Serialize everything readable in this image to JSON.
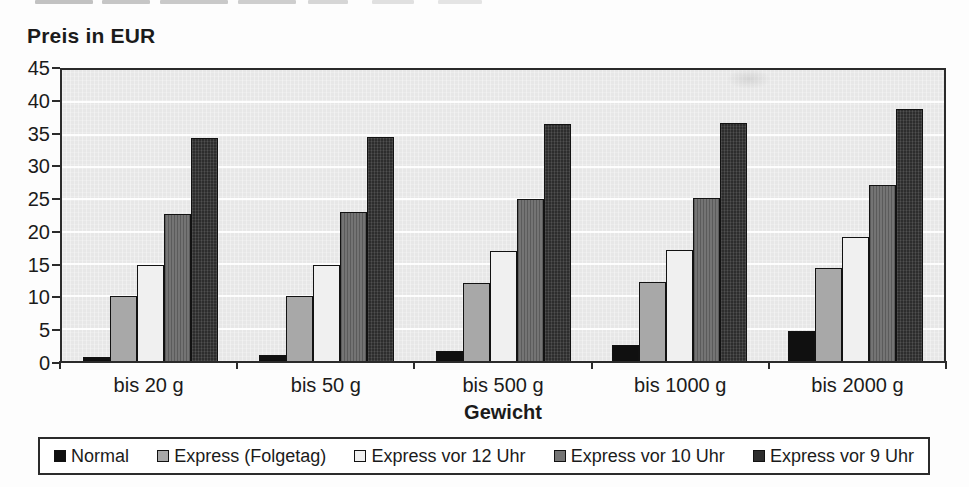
{
  "chart_data": {
    "type": "bar",
    "title": "Preis in EUR",
    "xlabel": "Gewicht",
    "ylabel": "Preis in EUR",
    "categories": [
      "bis 20 g",
      "bis 50 g",
      "bis 500 g",
      "bis 1000 g",
      "bis 2000 g"
    ],
    "series": [
      {
        "name": "Normal",
        "color": "#101010",
        "values": [
          0.6,
          1,
          1.6,
          2.5,
          4.7
        ]
      },
      {
        "name": "Express (Folgetag)",
        "color": "#a8a8a8",
        "values": [
          10,
          10.1,
          12,
          12.2,
          14.4
        ]
      },
      {
        "name": "Express vor 12 Uhr",
        "color": "#f0f0f0",
        "values": [
          14.8,
          14.9,
          17,
          17.1,
          19.2
        ]
      },
      {
        "name": "Express vor 10 Uhr",
        "color": "#747474",
        "values": [
          22.8,
          23,
          25,
          25.2,
          27.2
        ]
      },
      {
        "name": "Express vor 9 Uhr",
        "color": "#2d2d2d",
        "values": [
          34.5,
          34.7,
          36.6,
          36.8,
          39
        ]
      }
    ],
    "ylim": [
      0,
      45
    ],
    "yticks": [
      0,
      5,
      10,
      15,
      20,
      25,
      30,
      35,
      40,
      45
    ],
    "grid": "horizontal",
    "grid_color": "#ffffff",
    "plot_background": "#e7e7e7",
    "legend_position": "bottom"
  }
}
